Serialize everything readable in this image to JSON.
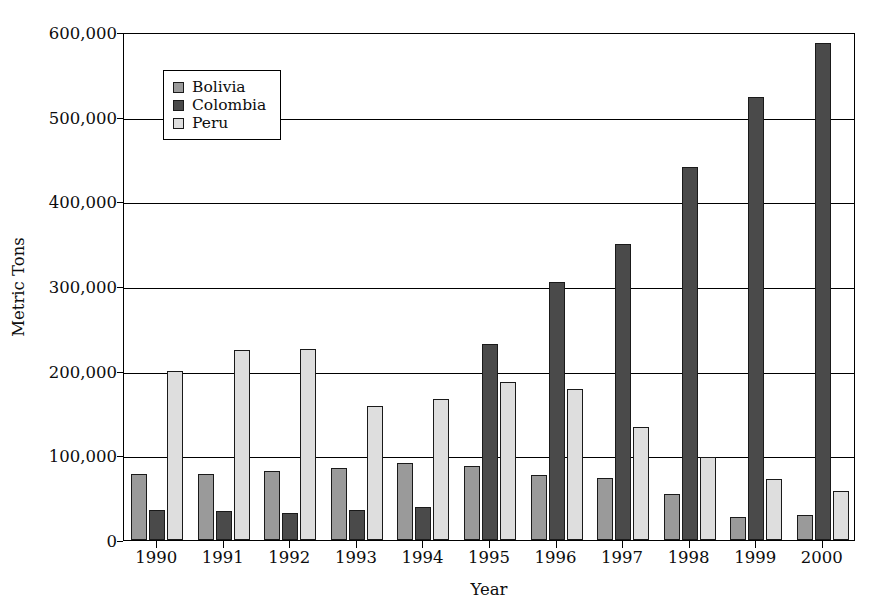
{
  "chart_data": {
    "type": "bar",
    "title": "",
    "xlabel": "Year",
    "ylabel": "Metric Tons",
    "categories": [
      "1990",
      "1991",
      "1992",
      "1993",
      "1994",
      "1995",
      "1996",
      "1997",
      "1998",
      "1999",
      "2000"
    ],
    "series": [
      {
        "name": "Bolivia",
        "color": "#9a9a9a",
        "values": [
          78000,
          78000,
          82000,
          85000,
          91000,
          87000,
          77000,
          73000,
          54000,
          27000,
          30000
        ]
      },
      {
        "name": "Colombia",
        "color": "#4a4a4a",
        "values": [
          35000,
          34000,
          32000,
          36000,
          39000,
          232000,
          305000,
          350000,
          440000,
          523000,
          587000
        ]
      },
      {
        "name": "Peru",
        "color": "#dedede",
        "values": [
          200000,
          225000,
          226000,
          158000,
          167000,
          187000,
          178000,
          133000,
          98000,
          72000,
          58000
        ]
      }
    ],
    "ylim": [
      0,
      600000
    ],
    "y_ticks": [
      0,
      100000,
      200000,
      300000,
      400000,
      500000,
      600000
    ],
    "y_tick_labels": [
      "0",
      "100,000",
      "200,000",
      "300,000",
      "400,000",
      "500,000",
      "600,000"
    ],
    "grid": true,
    "legend_position": "upper-left-inside"
  },
  "legend": {
    "items": [
      {
        "label": "Bolivia",
        "swatch_color": "#9a9a9a"
      },
      {
        "label": "Colombia",
        "swatch_color": "#4a4a4a"
      },
      {
        "label": "Peru",
        "swatch_color": "#dedede"
      }
    ]
  },
  "axes": {
    "y_title": "Metric Tons",
    "x_title": "Year"
  }
}
